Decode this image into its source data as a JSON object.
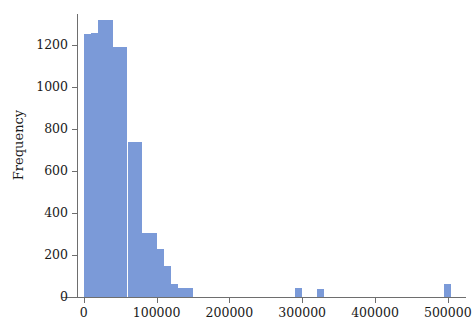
{
  "chart_data": {
    "type": "bar",
    "subtype": "histogram",
    "title": "",
    "xlabel": "",
    "ylabel": "Frequency",
    "xlim": [
      -8000,
      525000
    ],
    "ylim": [
      0,
      1350
    ],
    "grid": false,
    "legend": null,
    "bar_color": "#7b9ad8",
    "axis_color": "#6e6e6e",
    "text_color": "#1a1a1a",
    "bin_width": 10000,
    "xticks": [
      0,
      100000,
      200000,
      300000,
      400000,
      500000
    ],
    "xtick_labels": [
      "0",
      "100000",
      "200000",
      "300000",
      "400000",
      "500000"
    ],
    "yticks": [
      0,
      200,
      400,
      600,
      800,
      1000,
      1200
    ],
    "ytick_labels": [
      "0",
      "200",
      "400",
      "600",
      "800",
      "1000",
      "1200"
    ],
    "bins": [
      {
        "x0": 0,
        "x1": 10000,
        "count": 1255
      },
      {
        "x0": 10000,
        "x1": 20000,
        "count": 1258
      },
      {
        "x0": 20000,
        "x1": 30000,
        "count": 1320
      },
      {
        "x0": 30000,
        "x1": 40000,
        "count": 1320
      },
      {
        "x0": 40000,
        "x1": 50000,
        "count": 1192
      },
      {
        "x0": 50000,
        "x1": 60000,
        "count": 1192
      },
      {
        "x0": 60000,
        "x1": 70000,
        "count": 740
      },
      {
        "x0": 70000,
        "x1": 80000,
        "count": 740
      },
      {
        "x0": 80000,
        "x1": 90000,
        "count": 305
      },
      {
        "x0": 90000,
        "x1": 100000,
        "count": 305
      },
      {
        "x0": 100000,
        "x1": 110000,
        "count": 230
      },
      {
        "x0": 110000,
        "x1": 120000,
        "count": 150
      },
      {
        "x0": 120000,
        "x1": 130000,
        "count": 60
      },
      {
        "x0": 130000,
        "x1": 140000,
        "count": 45
      },
      {
        "x0": 140000,
        "x1": 150000,
        "count": 45
      },
      {
        "x0": 290000,
        "x1": 300000,
        "count": 45
      },
      {
        "x0": 320000,
        "x1": 330000,
        "count": 40
      },
      {
        "x0": 495000,
        "x1": 505000,
        "count": 60
      }
    ]
  }
}
